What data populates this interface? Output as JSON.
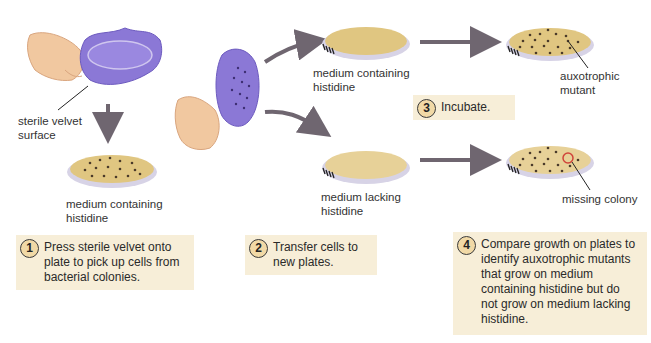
{
  "colors": {
    "velvet": "#8b78d6",
    "velvet_dark": "#6d5bbf",
    "agar": "#e0c681",
    "agar_light": "#e7d198",
    "dish_rim": "#d7d3e6",
    "colony": "#4a3a2a",
    "arrow": "#6f6670",
    "step_box": "#f7eed8",
    "badge_fill": "#f1d9a6",
    "missing_circle": "#d0443a",
    "skin": "#f1c8a0"
  },
  "labels": {
    "sterile_velvet": "sterile velvet\nsurface",
    "plate_master": "medium containing\nhistidine",
    "plate_with_his": "medium containing\nhistidine",
    "plate_without_his": "medium lacking\nhistidine",
    "auxotrophic_mutant": "auxotrophic\nmutant",
    "missing_colony": "missing colony"
  },
  "steps": [
    {
      "number": "1",
      "text": "Press sterile velvet onto plate to pick up cells from bacterial colonies."
    },
    {
      "number": "2",
      "text": "Transfer cells to new plates."
    },
    {
      "number": "3",
      "text": "Incubate."
    },
    {
      "number": "4",
      "text": "Compare growth on plates to identify auxotrophic mutants that grow on medium containing histidine but do not grow on medium lacking histidine."
    }
  ]
}
